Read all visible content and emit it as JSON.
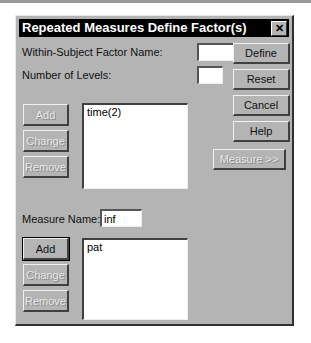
{
  "window": {
    "title": "Repeated Measures Define Factor(s)",
    "close_icon": "close-icon"
  },
  "factor": {
    "name_label": "Within-Subject Factor Name:",
    "name_value": "",
    "levels_label": "Number of Levels:",
    "levels_value": "",
    "buttons": {
      "add": "Add",
      "change": "Change",
      "remove": "Remove"
    },
    "list": [
      "time(2)"
    ]
  },
  "side_buttons": {
    "define": "Define",
    "reset": "Reset",
    "cancel": "Cancel",
    "help": "Help",
    "measure": "Measure >>"
  },
  "measure": {
    "name_label": "Measure Name:",
    "name_value": "inf",
    "buttons": {
      "add": "Add",
      "change": "Change",
      "remove": "Remove"
    },
    "list": [
      "pat"
    ]
  }
}
